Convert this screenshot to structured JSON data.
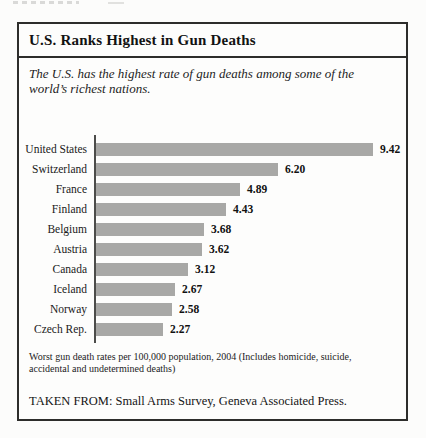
{
  "panel": {
    "title": "U.S. Ranks Highest in Gun Deaths",
    "subtitle": "The U.S. has the highest rate of gun deaths among some of the world’s richest nations.",
    "footnote": "Worst gun death rates per 100,000 population, 2004 (Includes homicide, suicide, accidental and undetermined deaths)",
    "source": "TAKEN FROM: Small Arms Survey, Geneva Associated Press."
  },
  "chart_data": {
    "type": "bar",
    "orientation": "horizontal",
    "title": "U.S. Ranks Highest in Gun Deaths",
    "categories": [
      "United States",
      "Switzerland",
      "France",
      "Finland",
      "Belgium",
      "Austria",
      "Canada",
      "Iceland",
      "Norway",
      "Czech Rep."
    ],
    "values": [
      9.42,
      6.2,
      4.89,
      4.43,
      3.68,
      3.62,
      3.12,
      2.67,
      2.58,
      2.27
    ],
    "value_labels": [
      "9.42",
      "6.20",
      "4.89",
      "4.43",
      "3.68",
      "3.62",
      "3.12",
      "2.67",
      "2.58",
      "2.27"
    ],
    "xlabel": "",
    "ylabel": "",
    "xlim": [
      0,
      9.42
    ],
    "grid": false,
    "legend": false,
    "bar_color": "#a8a8a6",
    "axis_color": "#4c4c4a",
    "max_bar_px": 277
  }
}
